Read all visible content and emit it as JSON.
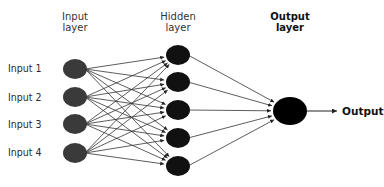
{
  "diagram": {
    "type": "feedforward-neural-network",
    "headers": {
      "input": [
        "Input",
        "layer"
      ],
      "hidden": [
        "Hidden",
        "layer"
      ],
      "output": [
        "Output",
        "layer"
      ]
    },
    "input_labels": [
      "Input 1",
      "Input 2",
      "Input 3",
      "Input 4"
    ],
    "output_label": "Output",
    "layers": [
      {
        "name": "input",
        "count": 4,
        "x": 75,
        "ys": [
          69,
          97,
          124,
          153
        ],
        "rx": 12,
        "ry": 10,
        "color": "#3a3a3a"
      },
      {
        "name": "hidden",
        "count": 5,
        "x": 178,
        "ys": [
          55,
          82,
          110,
          138,
          166
        ],
        "rx": 12,
        "ry": 10,
        "color": "#111111"
      },
      {
        "name": "output",
        "count": 1,
        "x": 290,
        "ys": [
          111
        ],
        "rx": 17,
        "ry": 14,
        "color": "#000000"
      }
    ],
    "connections": "fully-connected input→hidden→output, arrows pointing right"
  }
}
